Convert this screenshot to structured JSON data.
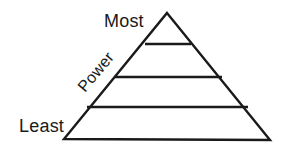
{
  "diagram": {
    "type": "pyramid-hierarchy",
    "background_color": "#ffffff",
    "stroke_color": "#1a1a1a",
    "stroke_width": 2,
    "shape": {
      "name": "triangle",
      "apex": {
        "x": 167,
        "y": 13
      },
      "bottom_left": {
        "x": 64,
        "y": 139
      },
      "bottom_right": {
        "x": 270,
        "y": 140
      }
    },
    "divider_lines": [
      {
        "index": 1,
        "y": 44,
        "x_start": 145,
        "x_end": 191
      },
      {
        "index": 2,
        "y": 77,
        "x_start": 115,
        "x_end": 222
      },
      {
        "index": 3,
        "y": 107,
        "x_start": 87,
        "x_end": 248
      }
    ],
    "tiers_count": 4,
    "labels": {
      "top": "Most",
      "bottom": "Least",
      "axis": "Power"
    },
    "axis_label_rotation_deg": -50
  }
}
